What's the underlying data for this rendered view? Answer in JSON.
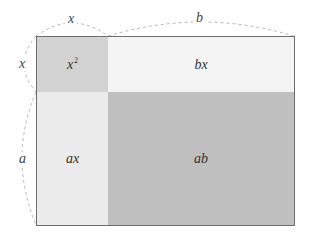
{
  "diagram": {
    "type": "area-model",
    "dimensions": {
      "top_left": "x",
      "top_right": "b",
      "left_top": "x",
      "left_bottom": "a"
    },
    "regions": {
      "top_left": {
        "base": "x",
        "exp": "2",
        "color": "#d2d2d2"
      },
      "top_right": {
        "label": "bx",
        "color": "#f4f4f4"
      },
      "bottom_left": {
        "label": "ax",
        "color": "#ebebeb"
      },
      "bottom_right": {
        "label": "ab",
        "color": "#bfbfbf"
      }
    },
    "colors": {
      "border": "#6e6e6e",
      "dashed": "#b5b5b5"
    }
  }
}
